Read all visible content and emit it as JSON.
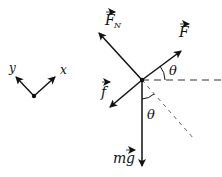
{
  "diagram": {
    "type": "free-body-diagram",
    "axes": {
      "x_label": "x",
      "y_label": "y"
    },
    "forces": [
      {
        "name": "normal-force",
        "label": "F",
        "subscript": "N",
        "vector": true,
        "direction": "up-left"
      },
      {
        "name": "applied-force",
        "label": "F",
        "vector": true,
        "direction": "up-right"
      },
      {
        "name": "friction-force",
        "label": "f",
        "vector": true,
        "direction": "down-left"
      },
      {
        "name": "weight",
        "label": "mg",
        "prefix": "m",
        "vector_part": "g",
        "vector": true,
        "direction": "down"
      }
    ],
    "angles": [
      {
        "label": "θ",
        "between": "F and horizontal"
      },
      {
        "label": "θ",
        "between": "mg and incline normal"
      }
    ],
    "colors": {
      "stroke": "#111111",
      "dash": "#333333",
      "background": "#ffffff"
    }
  }
}
